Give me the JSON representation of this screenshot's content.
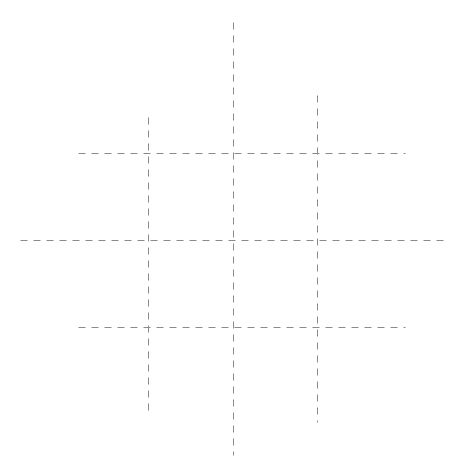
{
  "diagram": {
    "type": "tic-tac-toe-grid",
    "style": {
      "stroke": "#8a8a8a",
      "stroke_width": 1,
      "dash": [
        7,
        6
      ],
      "background": "#ffffff"
    },
    "vertical_lines": [
      {
        "id": "v1",
        "x": 148,
        "y1": 117,
        "y2": 415
      },
      {
        "id": "v2",
        "x": 233,
        "y1": 22,
        "y2": 455
      },
      {
        "id": "v3",
        "x": 317,
        "y1": 95,
        "y2": 422
      }
    ],
    "horizontal_lines": [
      {
        "id": "h1",
        "y": 153,
        "x1": 78,
        "x2": 405
      },
      {
        "id": "h2",
        "y": 240,
        "x1": 20,
        "x2": 445
      },
      {
        "id": "h3",
        "y": 327,
        "x1": 78,
        "x2": 405
      }
    ],
    "cells": [
      {
        "row": 0,
        "col": 0,
        "mark": ""
      },
      {
        "row": 0,
        "col": 1,
        "mark": ""
      },
      {
        "row": 0,
        "col": 2,
        "mark": ""
      },
      {
        "row": 1,
        "col": 0,
        "mark": ""
      },
      {
        "row": 1,
        "col": 1,
        "mark": ""
      },
      {
        "row": 1,
        "col": 2,
        "mark": ""
      },
      {
        "row": 2,
        "col": 0,
        "mark": ""
      },
      {
        "row": 2,
        "col": 1,
        "mark": ""
      },
      {
        "row": 2,
        "col": 2,
        "mark": ""
      }
    ]
  }
}
